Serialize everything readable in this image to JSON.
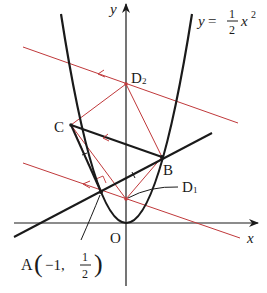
{
  "diagram": {
    "equation": {
      "lhs": "y",
      "eq": "=",
      "frac_num": "1",
      "frac_den": "2",
      "var": "x",
      "exp": "2"
    },
    "axes": {
      "x_label": "x",
      "y_label": "y",
      "origin_label": "O"
    },
    "points": {
      "A": {
        "label": "A",
        "coord_open": "(",
        "coord_x": "−1,",
        "coord_num": "1",
        "coord_den": "2",
        "coord_close": ")"
      },
      "B": {
        "label": "B"
      },
      "C": {
        "label": "C"
      },
      "D1": {
        "label": "D",
        "sub": "1"
      },
      "D2": {
        "label": "D",
        "sub": "2"
      }
    },
    "colors": {
      "curve": "#1a1a1a",
      "construction": "#c0393b"
    }
  }
}
